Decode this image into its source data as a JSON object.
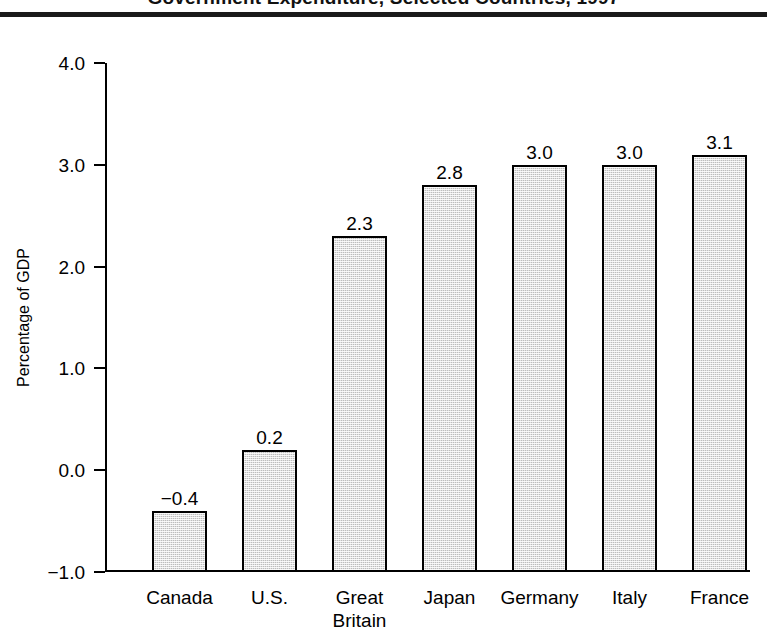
{
  "title": "Government Expenditure, Selected Countries, 1997",
  "axis": {
    "ylabel": "Percentage of GDP",
    "yticks": [
      "4.0",
      "3.0",
      "2.0",
      "1.0",
      "0.0",
      "−1.0"
    ]
  },
  "chart_data": {
    "type": "bar",
    "title": "Government Expenditure, Selected Countries, 1997",
    "xlabel": "",
    "ylabel": "Percentage of GDP",
    "ylim": [
      -1.0,
      4.0
    ],
    "ytick_values": [
      4.0,
      3.0,
      2.0,
      1.0,
      0.0,
      -1.0
    ],
    "ytick_labels": [
      "4.0",
      "3.0",
      "2.0",
      "1.0",
      "0.0",
      "−1.0"
    ],
    "grid": false,
    "legend": "none",
    "bar_baseline": -1.0,
    "categories": [
      "Canada",
      "U.S.",
      "Great\nBritain",
      "Japan",
      "Germany",
      "Italy",
      "France"
    ],
    "values": [
      -0.4,
      0.2,
      2.3,
      2.8,
      3.0,
      3.0,
      3.1
    ],
    "value_labels": [
      "−0.4",
      "0.2",
      "2.3",
      "2.8",
      "3.0",
      "3.0",
      "3.1"
    ],
    "bar_fill": "#bdbdbd",
    "bar_edge": "#000000"
  }
}
